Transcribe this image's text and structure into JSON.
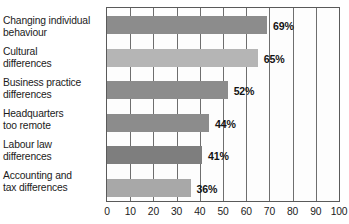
{
  "chart_data": {
    "type": "bar",
    "orientation": "horizontal",
    "title": "",
    "subtitle": "",
    "xlabel": "",
    "ylabel": "",
    "xlim": [
      0,
      100
    ],
    "grid": true,
    "legend": false,
    "categories": [
      "Changing individual behaviour",
      "Cultural differences",
      "Business practice differences",
      "Headquarters too remote",
      "Labour law differences",
      "Accounting and tax differences"
    ],
    "values": [
      69,
      65,
      52,
      44,
      41,
      36
    ],
    "value_labels": [
      "69%",
      "65%",
      "52%",
      "44%",
      "41%",
      "36%"
    ],
    "bar_colors": [
      "#8c8c8c",
      "#b5b5b5",
      "#8c8c8c",
      "#8c8c8c",
      "#7e7e7e",
      "#a8a8a8"
    ],
    "xticks": [
      0,
      10,
      20,
      30,
      40,
      50,
      60,
      70,
      80,
      90,
      100
    ],
    "xtick_labels": [
      "0",
      "10",
      "20",
      "30",
      "40",
      "50",
      "60",
      "70",
      "80",
      "90",
      "100"
    ],
    "axis_color": "#5a5a5a",
    "grid_color": "#6e6e6e",
    "plot_background": "#fdfdfd",
    "text_color": "#1b1b1b"
  },
  "categories_wrapped": [
    "Changing individual\nbehaviour",
    "Cultural\ndifferences",
    "Business practice\ndifferences",
    "Headquarters\ntoo remote",
    "Labour law\ndifferences",
    "Accounting and\ntax differences"
  ]
}
